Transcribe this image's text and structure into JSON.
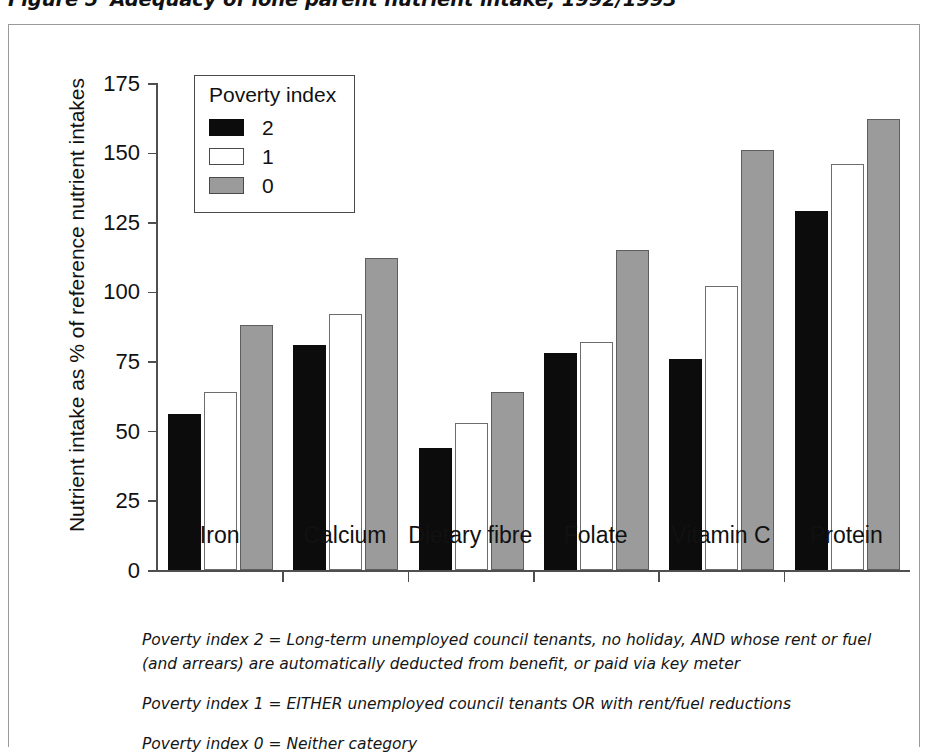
{
  "figure": {
    "number": "Figure 5",
    "caption": "Adequacy of lone parent nutrient intake, 1992/1993"
  },
  "legend": {
    "title": "Poverty index",
    "entries": [
      {
        "label": "2",
        "color": "#0c0c0c"
      },
      {
        "label": "1",
        "color": "#ffffff"
      },
      {
        "label": "0",
        "color": "#9b9b9b"
      }
    ]
  },
  "footnotes": [
    "Poverty index 2 = Long-term unemployed council tenants, no holiday, AND whose rent or fuel (and arrears) are automatically deducted from benefit, or paid via key meter",
    "Poverty index 1 = EITHER unemployed council tenants OR with rent/fuel reductions",
    "Poverty index 0 = Neither category"
  ],
  "chart_data": {
    "type": "bar",
    "title": "Adequacy of lone parent nutrient intake, 1992/1993",
    "xlabel": "",
    "ylabel": "Nutrient intake as % of reference nutrient intakes",
    "ylim": [
      0,
      175
    ],
    "yticks": [
      0,
      25,
      50,
      75,
      100,
      125,
      150,
      175
    ],
    "ytick_labels": [
      "0",
      "25",
      "50",
      "75",
      "100",
      "125",
      "150",
      "175"
    ],
    "grid": false,
    "legend_position": "upper-left-inside",
    "legend_title": "Poverty index",
    "categories": [
      "Iron",
      "Calcium",
      "Dietary fibre",
      "Folate",
      "Vitamin C",
      "Protein"
    ],
    "series": [
      {
        "name": "2",
        "color": "#0c0c0c",
        "values": [
          56,
          81,
          44,
          78,
          76,
          129
        ]
      },
      {
        "name": "1",
        "color": "#ffffff",
        "values": [
          64,
          92,
          53,
          82,
          102,
          146
        ]
      },
      {
        "name": "0",
        "color": "#9b9b9b",
        "values": [
          88,
          112,
          64,
          115,
          151,
          162
        ]
      }
    ]
  }
}
